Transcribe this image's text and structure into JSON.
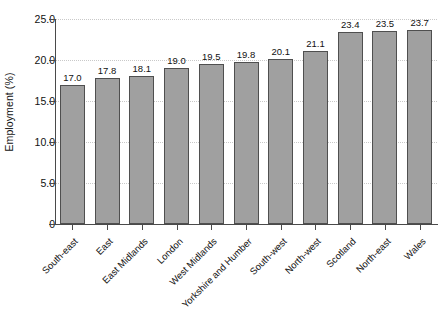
{
  "chart_data": {
    "type": "bar",
    "title": "",
    "xlabel": "",
    "ylabel": "Employment (%)",
    "categories": [
      "South-east",
      "East",
      "East Midlands",
      "London",
      "West Midlands",
      "Yorkshire and Humber",
      "South-west",
      "North-west",
      "Scotland",
      "North-east",
      "Wales"
    ],
    "values": [
      17.0,
      17.8,
      18.1,
      19.0,
      19.5,
      19.8,
      20.1,
      21.1,
      23.4,
      23.5,
      23.7
    ],
    "value_labels": [
      "17.0",
      "17.8",
      "18.1",
      "19.0",
      "19.5",
      "19.8",
      "20.1",
      "21.1",
      "23.4",
      "23.5",
      "23.7"
    ],
    "ylim": [
      0,
      25
    ],
    "yticks": [
      0,
      5,
      10,
      15,
      20,
      25
    ],
    "ytick_labels": [
      "0",
      "5.0",
      "10.0",
      "15.0",
      "20.0",
      "25.0"
    ],
    "grid": "horizontal-dotted",
    "legend": "none",
    "bar_color": "#a0a0a0",
    "bar_edge_color": "#4f4f4f",
    "axis_color": "#4a4a4a",
    "grid_color": "#c9c9c9",
    "background": "#ffffff"
  }
}
